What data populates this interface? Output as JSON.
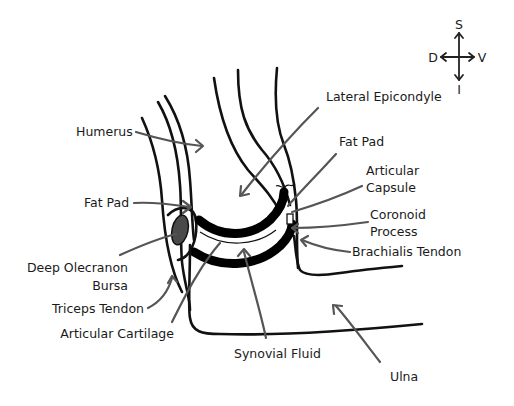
{
  "figure": {
    "compass": {
      "top": "S",
      "bottom": "I",
      "left": "D",
      "right": "V"
    },
    "labels": {
      "humerus": "Humerus",
      "fat_pad_left": "Fat Pad",
      "deep_olecranon_bursa_line1": "Deep Olecranon",
      "deep_olecranon_bursa_line2": "Bursa",
      "triceps_tendon": "Triceps Tendon",
      "articular_cartilage": "Articular Cartilage",
      "synovial_fluid": "Synovial Fluid",
      "ulna": "Ulna",
      "lateral_epicondyle": "Lateral Epicondyle",
      "fat_pad_right": "Fat Pad",
      "articular_capsule_line1": "Articular",
      "articular_capsule_line2": "Capsule",
      "coronoid_process_line1": "Coronoid",
      "coronoid_process_line2": "Process",
      "brachialis_tendon": "Brachialis Tendon"
    },
    "colors": {
      "outline": "#111111",
      "pointer": "#555555",
      "bursa_fill": "#4a4a4a",
      "background": "#ffffff"
    }
  }
}
